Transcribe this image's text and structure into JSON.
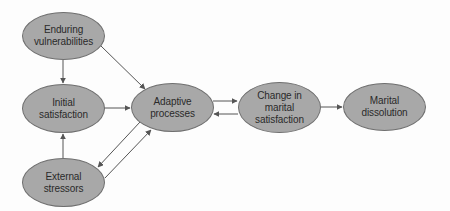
{
  "diagram": {
    "type": "flow",
    "colors": {
      "node_fill": "#a8a8a8",
      "node_border": "#6f6f6f",
      "edge": "#555555",
      "text": "#2a2a2a",
      "background": "#fdfdfd"
    },
    "nodes": [
      {
        "id": "enduring",
        "label": "Enduring\nvulnerabilities",
        "cx": 63,
        "cy": 36,
        "rx": 41,
        "ry": 24
      },
      {
        "id": "initial",
        "label": "Initial\nsatisfaction",
        "cx": 63,
        "cy": 108,
        "rx": 41,
        "ry": 24
      },
      {
        "id": "external",
        "label": "External\nstressors",
        "cx": 63,
        "cy": 182,
        "rx": 41,
        "ry": 24
      },
      {
        "id": "adaptive",
        "label": "Adaptive\nprocesses",
        "cx": 172,
        "cy": 107,
        "rx": 41,
        "ry": 24
      },
      {
        "id": "change",
        "label": "Change in\nmarital\nsatisfaction",
        "cx": 279,
        "cy": 107,
        "rx": 41,
        "ry": 25
      },
      {
        "id": "dissolution",
        "label": "Marital\ndissolution",
        "cx": 384,
        "cy": 107,
        "rx": 41,
        "ry": 24
      }
    ],
    "edges": [
      {
        "from": "enduring",
        "to": "initial"
      },
      {
        "from": "enduring",
        "to": "adaptive"
      },
      {
        "from": "initial",
        "to": "adaptive"
      },
      {
        "from": "external",
        "to": "initial"
      },
      {
        "from": "adaptive",
        "to": "external"
      },
      {
        "from": "external",
        "to": "adaptive"
      },
      {
        "from": "adaptive",
        "to": "change"
      },
      {
        "from": "change",
        "to": "adaptive"
      },
      {
        "from": "change",
        "to": "dissolution"
      }
    ]
  }
}
